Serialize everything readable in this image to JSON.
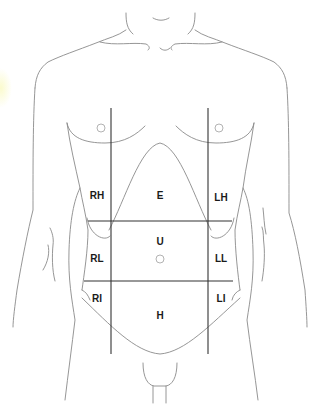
{
  "figure": {
    "colors": {
      "outline": "#8a8a8a",
      "grid_line": "#333333",
      "label": "#1a1a1a",
      "nipple": "#aaaaaa"
    }
  },
  "regions": [
    {
      "id": "RH",
      "label": "RH",
      "x": 97,
      "y": 196
    },
    {
      "id": "E",
      "label": "E",
      "x": 160,
      "y": 196
    },
    {
      "id": "LH",
      "label": "LH",
      "x": 221,
      "y": 196
    },
    {
      "id": "U",
      "label": "U",
      "x": 160,
      "y": 242
    },
    {
      "id": "RL",
      "label": "RL",
      "x": 97,
      "y": 259
    },
    {
      "id": "LL",
      "label": "LL",
      "x": 221,
      "y": 259
    },
    {
      "id": "RI",
      "label": "RI",
      "x": 97,
      "y": 299
    },
    {
      "id": "LI",
      "label": "LI",
      "x": 221,
      "y": 299
    },
    {
      "id": "H",
      "label": "H",
      "x": 160,
      "y": 316
    }
  ]
}
